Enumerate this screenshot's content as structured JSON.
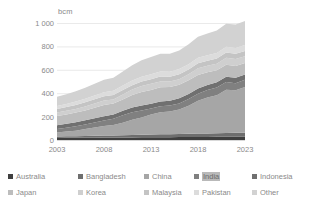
{
  "chart_data": {
    "type": "area",
    "stacked": true,
    "title": "",
    "subtitle": "",
    "xlabel": "",
    "ylabel": "bcm",
    "unit": "bcm",
    "grid": true,
    "legend_position": "bottom",
    "xlim": [
      2003,
      2023
    ],
    "ylim": [
      0,
      1000
    ],
    "ytick_labels": [
      "0",
      "200",
      "400",
      "600",
      "800",
      "1 000"
    ],
    "ytick_values": [
      0,
      200,
      400,
      600,
      800,
      1000
    ],
    "xtick_labels": [
      "2003",
      "2008",
      "2013",
      "2018",
      "2023"
    ],
    "xtick_values": [
      2003,
      2008,
      2013,
      2018,
      2023
    ],
    "x": [
      2003,
      2004,
      2005,
      2006,
      2007,
      2008,
      2009,
      2010,
      2011,
      2012,
      2013,
      2014,
      2015,
      2016,
      2017,
      2018,
      2019,
      2020,
      2021,
      2022,
      2023
    ],
    "series": [
      {
        "name": "Australia",
        "color": "#3f3f3f",
        "values": [
          18,
          19,
          19,
          20,
          20,
          21,
          21,
          22,
          22,
          23,
          23,
          24,
          24,
          25,
          25,
          26,
          26,
          27,
          27,
          28,
          28
        ]
      },
      {
        "name": "Bangladesh",
        "color": "#6e6e6e",
        "values": [
          12,
          13,
          14,
          15,
          16,
          17,
          18,
          19,
          20,
          22,
          24,
          25,
          26,
          27,
          28,
          29,
          30,
          31,
          32,
          33,
          34
        ]
      },
      {
        "name": "China",
        "color": "#a6a6a6",
        "values": [
          34,
          40,
          47,
          58,
          70,
          81,
          90,
          107,
          131,
          148,
          171,
          188,
          194,
          209,
          240,
          281,
          307,
          325,
          370,
          365,
          390
        ]
      },
      {
        "name": "India",
        "color": "#808080",
        "values": [
          31,
          33,
          37,
          40,
          44,
          48,
          52,
          64,
          64,
          60,
          51,
          51,
          50,
          52,
          57,
          60,
          64,
          65,
          66,
          60,
          62
        ]
      },
      {
        "name": "Indonesia",
        "color": "#707070",
        "values": [
          32,
          33,
          34,
          35,
          36,
          37,
          38,
          39,
          40,
          41,
          41,
          42,
          42,
          43,
          43,
          44,
          44,
          45,
          45,
          46,
          46
        ]
      },
      {
        "name": "Japan",
        "color": "#bdbdbd",
        "values": [
          79,
          81,
          83,
          85,
          90,
          95,
          92,
          95,
          107,
          117,
          117,
          121,
          118,
          116,
          117,
          116,
          108,
          104,
          103,
          100,
          98
        ]
      },
      {
        "name": "Korea",
        "color": "#cfcfcf",
        "values": [
          28,
          30,
          32,
          34,
          36,
          38,
          36,
          43,
          47,
          50,
          53,
          50,
          45,
          48,
          51,
          57,
          56,
          55,
          60,
          60,
          58
        ]
      },
      {
        "name": "Malaysia",
        "color": "#c4c4c4",
        "values": [
          32,
          33,
          34,
          35,
          36,
          37,
          37,
          38,
          38,
          39,
          40,
          41,
          41,
          42,
          42,
          43,
          43,
          44,
          44,
          45,
          45
        ]
      },
      {
        "name": "Pakistan",
        "color": "#dcdcdc",
        "values": [
          24,
          26,
          28,
          30,
          32,
          34,
          36,
          38,
          40,
          41,
          42,
          43,
          43,
          44,
          45,
          46,
          47,
          48,
          49,
          50,
          51
        ]
      },
      {
        "name": "Other",
        "color": "#d2d2d2",
        "values": [
          80,
          84,
          88,
          94,
          100,
          106,
          112,
          120,
          130,
          140,
          148,
          153,
          155,
          160,
          170,
          180,
          186,
          192,
          198,
          200,
          206
        ]
      }
    ]
  },
  "axis": {
    "unit_label": "bcm"
  },
  "legend": {
    "rows": [
      [
        {
          "label": "Australia",
          "color": "#3f3f3f",
          "highlight": false
        },
        {
          "label": "Bangladesh",
          "color": "#6e6e6e",
          "highlight": false
        },
        {
          "label": "China",
          "color": "#a6a6a6",
          "highlight": false
        },
        {
          "label": "India",
          "color": "#808080",
          "highlight": true
        },
        {
          "label": "Indonesia",
          "color": "#707070",
          "highlight": false
        }
      ],
      [
        {
          "label": "Japan",
          "color": "#bdbdbd",
          "highlight": false
        },
        {
          "label": "Korea",
          "color": "#cfcfcf",
          "highlight": false
        },
        {
          "label": "Malaysia",
          "color": "#c4c4c4",
          "highlight": false
        },
        {
          "label": "Pakistan",
          "color": "#dcdcdc",
          "highlight": false
        },
        {
          "label": "Other",
          "color": "#d2d2d2",
          "highlight": false
        }
      ]
    ]
  },
  "colors": {
    "background": "#ffffff",
    "grid": "#e4e4e4",
    "axis_text": "#8a8a8a"
  }
}
